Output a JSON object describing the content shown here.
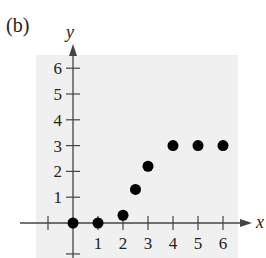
{
  "panel_label": "(b)",
  "chart_data": {
    "type": "scatter",
    "title": "",
    "xlabel": "x",
    "ylabel": "y",
    "x_ticks": [
      1,
      2,
      3,
      4,
      5,
      6
    ],
    "y_ticks": [
      1,
      2,
      3,
      4,
      5,
      6
    ],
    "xlim": [
      -1,
      6.9
    ],
    "ylim": [
      -1.2,
      6.6
    ],
    "grid": false,
    "background": "#f0f0f0",
    "series": [
      {
        "name": "points",
        "color": "#000000",
        "points": [
          {
            "x": 0,
            "y": 0
          },
          {
            "x": 1,
            "y": 0
          },
          {
            "x": 2,
            "y": 0.3
          },
          {
            "x": 2.5,
            "y": 1.3
          },
          {
            "x": 3,
            "y": 2.2
          },
          {
            "x": 4,
            "y": 3
          },
          {
            "x": 5,
            "y": 3
          },
          {
            "x": 6,
            "y": 3
          }
        ]
      }
    ]
  }
}
